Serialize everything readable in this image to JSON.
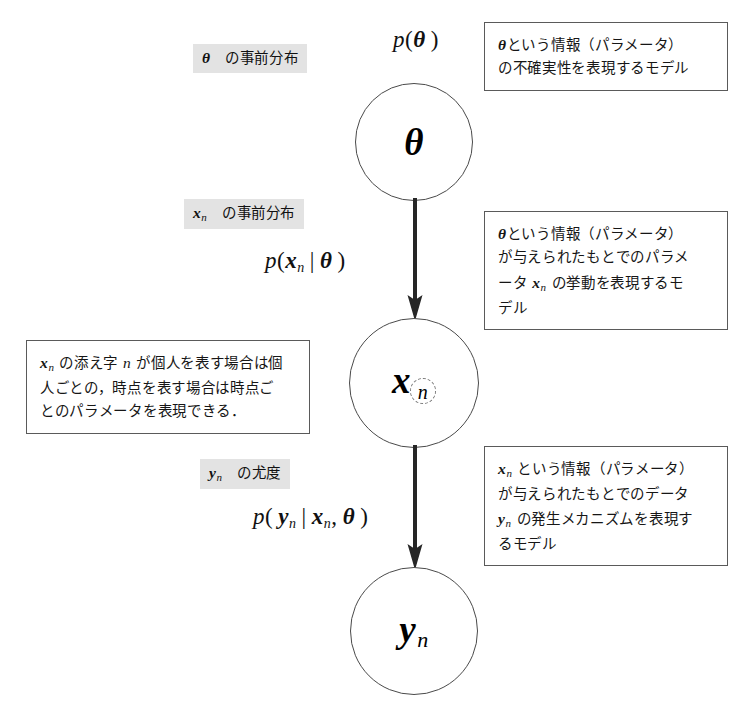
{
  "diagram": {
    "nodes": [
      {
        "id": "theta",
        "symbol": "θ",
        "subscript": ""
      },
      {
        "id": "x_n",
        "symbol": "x",
        "subscript": "n"
      },
      {
        "id": "y_n",
        "symbol": "y",
        "subscript": "n"
      }
    ],
    "formulas": [
      {
        "id": "p-theta",
        "text": "p(θ)"
      },
      {
        "id": "p-x-given-theta",
        "text": "p(xₙ|θ)"
      },
      {
        "id": "p-y-given-x-theta",
        "text": "p(yₙ|xₙ, θ)"
      }
    ],
    "side_labels": [
      {
        "id": "label-theta-prior",
        "text": "θ の事前分布"
      },
      {
        "id": "label-x-prior",
        "text": "xₙ の事前分布"
      },
      {
        "id": "label-y-likelihood",
        "text": "yₙ の尤度"
      }
    ],
    "notes": [
      {
        "id": "note-theta",
        "lines": [
          "θという情報（パラメータ）",
          "の不確実性を表現するモデル"
        ]
      },
      {
        "id": "note-x",
        "lines": [
          "θという情報（パラメータ）",
          "が与えられたもとでのパラメ",
          "ータ xₙ の挙動を表現するモ",
          "デル"
        ]
      },
      {
        "id": "note-x-subscript",
        "lines": [
          "xₙ の添え字 n が個人を表す場合は個",
          "人ごとの，時点を表す場合は時点ご",
          "とのパラメータを表現できる．"
        ]
      },
      {
        "id": "note-y",
        "lines": [
          "xₙ という情報（パラメータ）",
          "が与えられたもとでのデータ",
          "yₙ の発生メカニズムを表現す",
          "るモデル"
        ]
      }
    ],
    "arrows": [
      {
        "id": "arrow-theta-to-x",
        "from": "theta",
        "to": "x_n"
      },
      {
        "id": "arrow-x-to-y",
        "from": "x_n",
        "to": "y_n"
      }
    ],
    "colors": {
      "node_stroke": "#4a4a4a",
      "box_stroke": "#5a5a5a",
      "highlight_bg": "#e3e3e3",
      "arrow": "#262626",
      "text": "#161616",
      "background": "#ffffff"
    }
  }
}
